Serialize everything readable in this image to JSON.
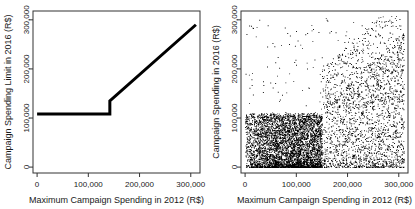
{
  "figure": {
    "background": "#ffffff",
    "axis_color": "#333333",
    "point_color": "#000000",
    "line_color": "#000000",
    "panel_count": 2
  },
  "chart_data": [
    {
      "type": "line",
      "panel": "left",
      "title": "",
      "xlabel": "Maximum Campaign Spending in 2012 (R$)",
      "ylabel": "Campaign Spending Limit in 2016 (R$)",
      "xlim": [
        -8000,
        318000
      ],
      "ylim": [
        -12000,
        318000
      ],
      "xticks": [
        0,
        100000,
        200000,
        300000
      ],
      "xticklabels": [
        "0",
        "100,000",
        "200,000",
        "300,000"
      ],
      "yticks": [
        0,
        100000,
        200000,
        300000
      ],
      "yticklabels": [
        "0",
        "100,000",
        "200,000",
        "300,000"
      ],
      "grid": false,
      "legend": "none",
      "series": [
        {
          "name": "2016 spending limit rule",
          "linewidth": 3,
          "x": [
            0,
            142000,
            142000,
            310000
          ],
          "y": [
            108000,
            108000,
            135000,
            290000
          ],
          "description": "Flat cap of R$108,000 for 2012 maximum spending up to R$142,000; discontinuous upward jump at R$142,000 then linear increase to about R$290,000 at R$310,000"
        }
      ],
      "annotations": [
        {
          "label": "discontinuity",
          "x": 142000,
          "y_low": 108000,
          "y_high": 135000
        }
      ]
    },
    {
      "type": "scatter",
      "panel": "right",
      "title": "",
      "xlabel": "Maximum Campaign Spending in 2012 (R$)",
      "ylabel": "Campaign Spending in 2016 (R$)",
      "xlim": [
        -8000,
        318000
      ],
      "ylim": [
        -12000,
        318000
      ],
      "xticks": [
        0,
        100000,
        200000,
        300000
      ],
      "xticklabels": [
        "0",
        "100,000",
        "200,000",
        "300,000"
      ],
      "yticks": [
        0,
        100000,
        200000,
        300000
      ],
      "yticklabels": [
        "0",
        "100,000",
        "200,000",
        "300,000"
      ],
      "grid": false,
      "legend": "none",
      "marker": ".",
      "marker_size": 1,
      "n_points_approx": 7000,
      "density_description": "Very dense black mass for x below 150,000 concentrated under y = 110,000; above x = 150,000 the cloud fans out upward reaching y near 300,000; sparse scattered outliers up to 300,000 throughout",
      "density_regions": [
        {
          "x_range": [
            0,
            150000
          ],
          "y_range": [
            0,
            110000
          ],
          "density": "saturated"
        },
        {
          "x_range": [
            150000,
            310000
          ],
          "y_range": [
            0,
            160000
          ],
          "density": "heavy"
        },
        {
          "x_range": [
            150000,
            310000
          ],
          "y_range": [
            160000,
            300000
          ],
          "density": "sparse"
        },
        {
          "x_range": [
            0,
            150000
          ],
          "y_range": [
            110000,
            300000
          ],
          "density": "very-sparse"
        }
      ]
    }
  ]
}
